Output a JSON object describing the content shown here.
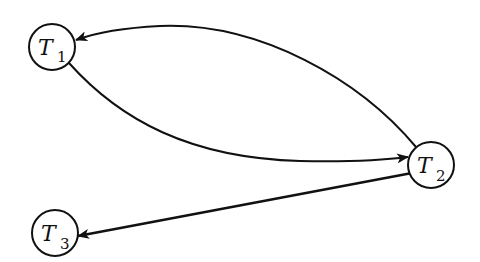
{
  "diagram": {
    "type": "directed-graph",
    "colors": {
      "stroke": "#111111",
      "background": "#ffffff"
    },
    "nodes": [
      {
        "id": "T1",
        "label": "T",
        "subscript": "1",
        "cx": 52,
        "cy": 47,
        "r": 23
      },
      {
        "id": "T2",
        "label": "T",
        "subscript": "2",
        "cx": 431,
        "cy": 165,
        "r": 23
      },
      {
        "id": "T3",
        "label": "T",
        "subscript": "3",
        "cx": 55,
        "cy": 233,
        "r": 23
      }
    ],
    "edges": [
      {
        "from": "T2",
        "to": "T1",
        "shape": "curved-upper"
      },
      {
        "from": "T1",
        "to": "T2",
        "shape": "curved-lower"
      },
      {
        "from": "T2",
        "to": "T3",
        "shape": "straight"
      }
    ]
  }
}
